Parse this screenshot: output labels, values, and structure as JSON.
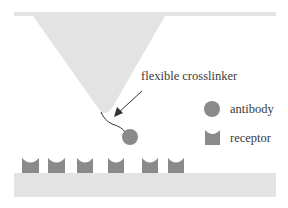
{
  "diagram": {
    "colors": {
      "cantilever": "#e3e3e3",
      "substrate": "#e3e3e3",
      "antibody": "#8a8a8a",
      "receptor": "#8a8a8a",
      "line": "#333333",
      "text": "#3a3a3a"
    },
    "labels": {
      "crosslinker": "flexible crosslinker"
    },
    "legend": [
      {
        "shape": "circle",
        "label": "antibody"
      },
      {
        "shape": "receptor",
        "label": "receptor"
      }
    ],
    "receptors_count": 6
  }
}
